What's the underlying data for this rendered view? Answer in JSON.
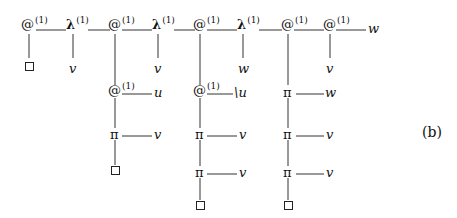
{
  "figure_tag": "(b)",
  "symbols": {
    "app": "@",
    "lambda": "λ",
    "pi": "π",
    "superscript": "(1)"
  },
  "top_row": [
    {
      "kind": "app",
      "label": "@",
      "sup": "(1)"
    },
    {
      "kind": "lambda",
      "label": "λ",
      "sup": "(1)"
    },
    {
      "kind": "app",
      "label": "@",
      "sup": "(1)"
    },
    {
      "kind": "lambda",
      "label": "λ",
      "sup": "(1)"
    },
    {
      "kind": "app",
      "label": "@",
      "sup": "(1)"
    },
    {
      "kind": "lambda",
      "label": "λ",
      "sup": "(1)"
    },
    {
      "kind": "app",
      "label": "@",
      "sup": "(1)"
    },
    {
      "kind": "app",
      "label": "@",
      "sup": "(1)"
    }
  ],
  "top_row_tail": "w",
  "second_row": [
    "□",
    "v",
    "v",
    "w",
    "v"
  ],
  "branches": [
    {
      "nodes": [
        {
          "label": "@",
          "sup": "(1)",
          "arg": "u"
        },
        {
          "label": "π",
          "arg": "v"
        }
      ],
      "end": "□"
    },
    {
      "nodes": [
        {
          "label": "@",
          "sup": "(1)",
          "arg": "\\u"
        },
        {
          "label": "π",
          "arg": "v"
        },
        {
          "label": "π",
          "arg": "v"
        }
      ],
      "end": "□"
    },
    {
      "nodes": [
        {
          "label": "π",
          "arg": "w"
        },
        {
          "label": "π",
          "arg": "v"
        },
        {
          "label": "π",
          "arg": "v"
        }
      ],
      "end": "□"
    }
  ]
}
